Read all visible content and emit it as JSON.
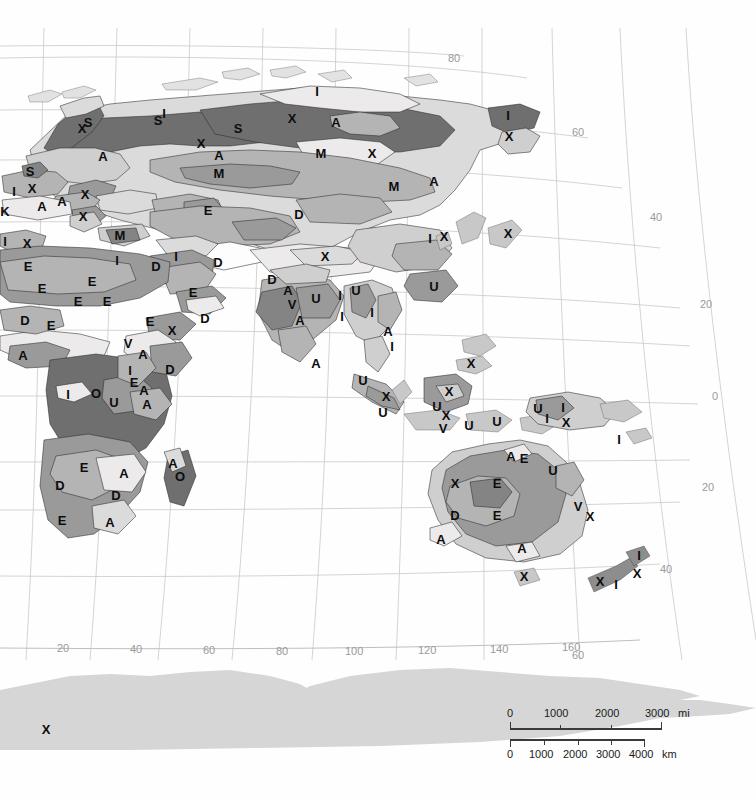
{
  "map": {
    "projection_kind": "curved-meridian world map (eastern hemisphere)",
    "background_color": "#ffffff",
    "graticule_color": "#c9c9c9",
    "land_outline_color": "#2b2b2b",
    "longitude_labels": [
      "20",
      "40",
      "60",
      "80",
      "100",
      "120",
      "140",
      "160"
    ],
    "latitude_labels_right": [
      "80",
      "60",
      "40",
      "20",
      "0",
      "20",
      "40"
    ],
    "corner_label_bottom_right": "60",
    "legend_codes": [
      "A",
      "D",
      "E",
      "I",
      "M",
      "O",
      "S",
      "U",
      "V",
      "X"
    ],
    "tones": {
      "white": "#fdfdfd",
      "very_light": "#eceaea",
      "light": "#dcdbdb",
      "medium_light": "#cfcfcf",
      "medium": "#b4b4b4",
      "medium_dark": "#9a9a9a",
      "dark": "#848484",
      "very_dark": "#6f6f6f",
      "ice": "#d6d6d6"
    },
    "region_labels": [
      {
        "code": "X",
        "x": 82,
        "y": 130
      },
      {
        "code": "S",
        "x": 88,
        "y": 124
      },
      {
        "code": "S",
        "x": 158,
        "y": 122
      },
      {
        "code": "I",
        "x": 164,
        "y": 115
      },
      {
        "code": "S",
        "x": 238,
        "y": 130
      },
      {
        "code": "X",
        "x": 292,
        "y": 120
      },
      {
        "code": "I",
        "x": 317,
        "y": 93
      },
      {
        "code": "A",
        "x": 336,
        "y": 124
      },
      {
        "code": "X",
        "x": 372,
        "y": 155
      },
      {
        "code": "I",
        "x": 508,
        "y": 117
      },
      {
        "code": "X",
        "x": 509,
        "y": 138
      },
      {
        "code": "A",
        "x": 103,
        "y": 158
      },
      {
        "code": "X",
        "x": 201,
        "y": 145
      },
      {
        "code": "A",
        "x": 219,
        "y": 157
      },
      {
        "code": "M",
        "x": 219,
        "y": 175
      },
      {
        "code": "M",
        "x": 321,
        "y": 155
      },
      {
        "code": "M",
        "x": 394,
        "y": 188
      },
      {
        "code": "A",
        "x": 434,
        "y": 183
      },
      {
        "code": "S",
        "x": 30,
        "y": 173
      },
      {
        "code": "I",
        "x": 14,
        "y": 193
      },
      {
        "code": "X",
        "x": 32,
        "y": 190
      },
      {
        "code": "A",
        "x": 42,
        "y": 208
      },
      {
        "code": "A",
        "x": 62,
        "y": 203
      },
      {
        "code": "X",
        "x": 85,
        "y": 196
      },
      {
        "code": "X",
        "x": 83,
        "y": 218
      },
      {
        "code": "K",
        "x": 5,
        "y": 213
      },
      {
        "code": "I",
        "x": 5,
        "y": 243
      },
      {
        "code": "X",
        "x": 27,
        "y": 245
      },
      {
        "code": "M",
        "x": 120,
        "y": 237
      },
      {
        "code": "E",
        "x": 208,
        "y": 212
      },
      {
        "code": "D",
        "x": 299,
        "y": 216
      },
      {
        "code": "X",
        "x": 325,
        "y": 258
      },
      {
        "code": "I",
        "x": 430,
        "y": 240
      },
      {
        "code": "X",
        "x": 444,
        "y": 238
      },
      {
        "code": "X",
        "x": 508,
        "y": 235
      },
      {
        "code": "D",
        "x": 156,
        "y": 268
      },
      {
        "code": "I",
        "x": 176,
        "y": 258
      },
      {
        "code": "D",
        "x": 218,
        "y": 264
      },
      {
        "code": "D",
        "x": 272,
        "y": 281
      },
      {
        "code": "A",
        "x": 288,
        "y": 292
      },
      {
        "code": "V",
        "x": 292,
        "y": 306
      },
      {
        "code": "U",
        "x": 316,
        "y": 300
      },
      {
        "code": "A",
        "x": 300,
        "y": 322
      },
      {
        "code": "I",
        "x": 340,
        "y": 297
      },
      {
        "code": "U",
        "x": 356,
        "y": 292
      },
      {
        "code": "I",
        "x": 342,
        "y": 318
      },
      {
        "code": "I",
        "x": 372,
        "y": 314
      },
      {
        "code": "A",
        "x": 388,
        "y": 333
      },
      {
        "code": "I",
        "x": 392,
        "y": 348
      },
      {
        "code": "U",
        "x": 434,
        "y": 288
      },
      {
        "code": "A",
        "x": 316,
        "y": 365
      },
      {
        "code": "E",
        "x": 28,
        "y": 268
      },
      {
        "code": "E",
        "x": 42,
        "y": 290
      },
      {
        "code": "E",
        "x": 92,
        "y": 283
      },
      {
        "code": "E",
        "x": 78,
        "y": 303
      },
      {
        "code": "E",
        "x": 107,
        "y": 303
      },
      {
        "code": "D",
        "x": 25,
        "y": 322
      },
      {
        "code": "E",
        "x": 51,
        "y": 327
      },
      {
        "code": "I",
        "x": 117,
        "y": 262
      },
      {
        "code": "E",
        "x": 150,
        "y": 323
      },
      {
        "code": "X",
        "x": 172,
        "y": 332
      },
      {
        "code": "D",
        "x": 205,
        "y": 320
      },
      {
        "code": "E",
        "x": 193,
        "y": 294
      },
      {
        "code": "A",
        "x": 23,
        "y": 357
      },
      {
        "code": "V",
        "x": 128,
        "y": 345
      },
      {
        "code": "A",
        "x": 143,
        "y": 356
      },
      {
        "code": "I",
        "x": 130,
        "y": 372
      },
      {
        "code": "E",
        "x": 134,
        "y": 384
      },
      {
        "code": "A",
        "x": 144,
        "y": 392
      },
      {
        "code": "D",
        "x": 170,
        "y": 371
      },
      {
        "code": "I",
        "x": 68,
        "y": 396
      },
      {
        "code": "O",
        "x": 96,
        "y": 395
      },
      {
        "code": "U",
        "x": 114,
        "y": 404
      },
      {
        "code": "A",
        "x": 147,
        "y": 406
      },
      {
        "code": "E",
        "x": 84,
        "y": 469
      },
      {
        "code": "D",
        "x": 60,
        "y": 487
      },
      {
        "code": "A",
        "x": 124,
        "y": 475
      },
      {
        "code": "D",
        "x": 116,
        "y": 497
      },
      {
        "code": "E",
        "x": 62,
        "y": 522
      },
      {
        "code": "A",
        "x": 110,
        "y": 524
      },
      {
        "code": "A",
        "x": 173,
        "y": 465
      },
      {
        "code": "O",
        "x": 180,
        "y": 478
      },
      {
        "code": "X",
        "x": 386,
        "y": 398
      },
      {
        "code": "U",
        "x": 383,
        "y": 414
      },
      {
        "code": "U",
        "x": 363,
        "y": 382
      },
      {
        "code": "U",
        "x": 437,
        "y": 408
      },
      {
        "code": "X",
        "x": 449,
        "y": 393
      },
      {
        "code": "X",
        "x": 446,
        "y": 417
      },
      {
        "code": "U",
        "x": 469,
        "y": 427
      },
      {
        "code": "V",
        "x": 443,
        "y": 430
      },
      {
        "code": "U",
        "x": 497,
        "y": 423
      },
      {
        "code": "X",
        "x": 471,
        "y": 365
      },
      {
        "code": "U",
        "x": 538,
        "y": 410
      },
      {
        "code": "I",
        "x": 563,
        "y": 409
      },
      {
        "code": "X",
        "x": 566,
        "y": 424
      },
      {
        "code": "I",
        "x": 547,
        "y": 420
      },
      {
        "code": "I",
        "x": 619,
        "y": 441
      },
      {
        "code": "A",
        "x": 511,
        "y": 458
      },
      {
        "code": "E",
        "x": 524,
        "y": 460
      },
      {
        "code": "U",
        "x": 553,
        "y": 472
      },
      {
        "code": "X",
        "x": 455,
        "y": 485
      },
      {
        "code": "E",
        "x": 497,
        "y": 485
      },
      {
        "code": "D",
        "x": 455,
        "y": 517
      },
      {
        "code": "E",
        "x": 497,
        "y": 517
      },
      {
        "code": "V",
        "x": 578,
        "y": 508
      },
      {
        "code": "X",
        "x": 590,
        "y": 518
      },
      {
        "code": "A",
        "x": 441,
        "y": 541
      },
      {
        "code": "A",
        "x": 522,
        "y": 550
      },
      {
        "code": "X",
        "x": 524,
        "y": 578
      },
      {
        "code": "I",
        "x": 639,
        "y": 557
      },
      {
        "code": "X",
        "x": 637,
        "y": 575
      },
      {
        "code": "X",
        "x": 600,
        "y": 583
      },
      {
        "code": "I",
        "x": 616,
        "y": 586
      },
      {
        "code": "X",
        "x": 46,
        "y": 731
      }
    ]
  },
  "scale_bar": {
    "miles": {
      "ticks": [
        "0",
        "1000",
        "2000",
        "3000"
      ],
      "unit": "mi"
    },
    "kilometers": {
      "ticks": [
        "0",
        "1000",
        "2000",
        "3000",
        "4000"
      ],
      "unit": "km"
    }
  }
}
